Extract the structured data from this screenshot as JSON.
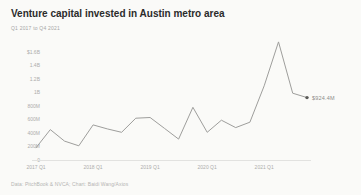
{
  "chart_data": {
    "type": "line",
    "title": "Venture capital invested in Austin metro area",
    "subtitle": "Q1 2017 to Q4 2021",
    "source": "Data: PitchBook & NVCA; Chart: Baidi Wang/Axios",
    "unit": "USD (millions)",
    "x": [
      "2017 Q1",
      "2017 Q2",
      "2017 Q3",
      "2017 Q4",
      "2018 Q1",
      "2018 Q2",
      "2018 Q3",
      "2018 Q4",
      "2019 Q1",
      "2019 Q2",
      "2019 Q3",
      "2019 Q4",
      "2020 Q1",
      "2020 Q2",
      "2020 Q3",
      "2020 Q4",
      "2021 Q1",
      "2021 Q2",
      "2021 Q3",
      "2021 Q4"
    ],
    "values": [
      180,
      450,
      280,
      210,
      520,
      460,
      410,
      620,
      630,
      470,
      310,
      780,
      410,
      590,
      480,
      560,
      1100,
      1750,
      990,
      924.4
    ],
    "end_label": "$924.4M",
    "ylim": [
      0,
      1600
    ],
    "y_ticks": [
      {
        "value": 1600,
        "label": "$1.6B"
      },
      {
        "value": 1400,
        "label": "1.4B"
      },
      {
        "value": 1200,
        "label": "1.2B"
      },
      {
        "value": 1000,
        "label": "1B"
      },
      {
        "value": 800,
        "label": "800M"
      },
      {
        "value": 600,
        "label": "600M"
      },
      {
        "value": 400,
        "label": "400M"
      },
      {
        "value": 200,
        "label": "200M"
      },
      {
        "value": 0,
        "label": "0"
      }
    ],
    "x_tick_indices": [
      0,
      4,
      8,
      12,
      16
    ],
    "x_tick_labels": [
      "2017 Q1",
      "2018 Q1",
      "2019 Q1",
      "2020 Q1",
      "2021 Q1"
    ],
    "grid": false,
    "legend": "none",
    "line_color": "#9e9e9c",
    "marker_color": "#5a5a58"
  }
}
